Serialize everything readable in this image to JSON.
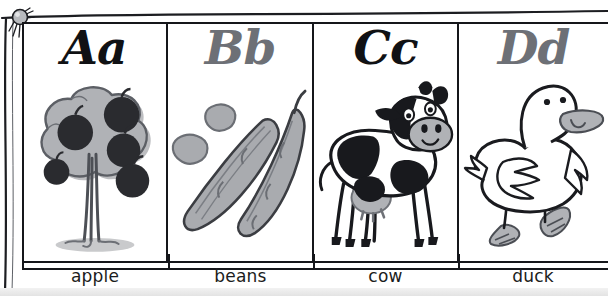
{
  "poster": {
    "title": "Alphabet picture chart",
    "pin_icon": "pushpin-icon",
    "background_color": "#ffffff",
    "frame_color": "#15161a",
    "dark_letter_color": "#101114",
    "gray_letter_color": "#6d7076"
  },
  "cells": [
    {
      "letter": "Aa",
      "letter_color": "dark",
      "caption": "apple",
      "illustration": "apple-tree-illustration"
    },
    {
      "letter": "Bb",
      "letter_color": "gray",
      "caption": "beans",
      "illustration": "bean-pods-illustration"
    },
    {
      "letter": "Cc",
      "letter_color": "dark",
      "caption": "cow",
      "illustration": "cow-illustration"
    },
    {
      "letter": "Dd",
      "letter_color": "gray",
      "caption": "duck",
      "illustration": "duck-illustration"
    }
  ]
}
